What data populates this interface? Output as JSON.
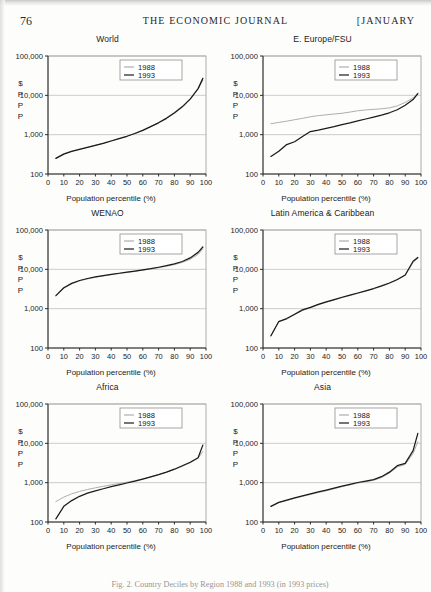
{
  "page": {
    "folio": "76",
    "journal_title": "THE ECONOMIC JOURNAL",
    "issue_month": "[JANUARY",
    "caption": "Fig. 2. Country Deciles by Region 1988 and 1993 (in 1993 prices)"
  },
  "legend": {
    "series_1988": "1988",
    "series_1993": "1993",
    "color_1988": "#aeaeae",
    "color_1993": "#1a1a1a"
  },
  "axes": {
    "y_unit_lines": [
      "$",
      "P",
      "P",
      "P"
    ],
    "y_ticks": [
      "100,000",
      "10,000",
      "1,000",
      "100"
    ],
    "y_tick_values": [
      100000,
      10000,
      1000,
      100
    ],
    "x_label": "Population percentile (%)",
    "x_ticks": [
      "0",
      "10",
      "20",
      "30",
      "40",
      "50",
      "60",
      "70",
      "80",
      "90",
      "100"
    ],
    "x_tick_values": [
      0,
      10,
      20,
      30,
      40,
      50,
      60,
      70,
      80,
      90,
      100
    ]
  },
  "chart_data": [
    {
      "type": "line",
      "title": "World",
      "xlabel": "Population percentile (%)",
      "ylabel": "$PPP",
      "yscale": "log",
      "ylim": [
        100,
        100000
      ],
      "xlim": [
        0,
        100
      ],
      "grid": true,
      "legend_position": "top-center",
      "x": [
        5,
        10,
        15,
        20,
        25,
        30,
        35,
        40,
        45,
        50,
        55,
        60,
        65,
        70,
        75,
        80,
        85,
        90,
        95,
        98
      ],
      "series": [
        {
          "name": "1988",
          "color": "#aeaeae",
          "values": [
            255,
            330,
            380,
            430,
            480,
            540,
            610,
            700,
            800,
            920,
            1080,
            1300,
            1620,
            2050,
            2700,
            3700,
            5300,
            8200,
            14500,
            24000
          ]
        },
        {
          "name": "1993",
          "color": "#1a1a1a",
          "values": [
            250,
            320,
            375,
            425,
            475,
            535,
            600,
            690,
            790,
            910,
            1070,
            1290,
            1600,
            2000,
            2600,
            3550,
            5100,
            8000,
            14800,
            27000
          ]
        }
      ]
    },
    {
      "type": "line",
      "title": "E. Europe/FSU",
      "xlabel": "Population percentile (%)",
      "ylabel": "$PPP",
      "yscale": "log",
      "ylim": [
        100,
        100000
      ],
      "xlim": [
        0,
        100
      ],
      "grid": true,
      "legend_position": "top-center",
      "x": [
        5,
        10,
        15,
        20,
        25,
        30,
        35,
        40,
        45,
        50,
        55,
        60,
        65,
        70,
        75,
        80,
        85,
        90,
        95,
        98
      ],
      "series": [
        {
          "name": "1988",
          "color": "#aeaeae",
          "values": [
            1900,
            2050,
            2200,
            2400,
            2600,
            2850,
            3050,
            3200,
            3350,
            3500,
            3750,
            4050,
            4250,
            4400,
            4550,
            4800,
            5400,
            6600,
            8600,
            11500
          ]
        },
        {
          "name": "1993",
          "color": "#1a1a1a",
          "values": [
            280,
            380,
            560,
            660,
            900,
            1200,
            1300,
            1450,
            1600,
            1800,
            2000,
            2250,
            2500,
            2800,
            3150,
            3600,
            4300,
            5600,
            7800,
            11000
          ]
        }
      ]
    },
    {
      "type": "line",
      "title": "WENAO",
      "xlabel": "Population percentile (%)",
      "ylabel": "$PPP",
      "yscale": "log",
      "ylim": [
        100,
        100000
      ],
      "xlim": [
        0,
        100
      ],
      "grid": true,
      "legend_position": "top-center",
      "x": [
        5,
        10,
        15,
        20,
        25,
        30,
        35,
        40,
        45,
        50,
        55,
        60,
        65,
        70,
        75,
        80,
        85,
        90,
        95,
        98
      ],
      "series": [
        {
          "name": "1988",
          "color": "#aeaeae",
          "values": [
            2100,
            3300,
            4300,
            5100,
            5700,
            6300,
            6800,
            7300,
            7800,
            8300,
            8900,
            9500,
            10200,
            11000,
            12000,
            13200,
            15000,
            18000,
            24000,
            33000
          ]
        },
        {
          "name": "1993",
          "color": "#1a1a1a",
          "values": [
            2150,
            3400,
            4400,
            5200,
            5850,
            6450,
            6950,
            7450,
            7950,
            8450,
            9050,
            9700,
            10400,
            11300,
            12400,
            13800,
            15800,
            19500,
            27000,
            37000
          ]
        }
      ]
    },
    {
      "type": "line",
      "title": "Latin America & Caribbean",
      "xlabel": "Population percentile (%)",
      "ylabel": "$PPP",
      "yscale": "log",
      "ylim": [
        100,
        100000
      ],
      "xlim": [
        0,
        100
      ],
      "grid": true,
      "legend_position": "top-center",
      "x": [
        5,
        10,
        15,
        20,
        25,
        30,
        35,
        40,
        45,
        50,
        55,
        60,
        65,
        70,
        75,
        80,
        85,
        90,
        95,
        98
      ],
      "series": [
        {
          "name": "1988",
          "color": "#aeaeae",
          "values": [
            200,
            480,
            540,
            700,
            900,
            1050,
            1250,
            1450,
            1650,
            1900,
            2150,
            2450,
            2800,
            3200,
            3700,
            4400,
            5400,
            7000,
            15000,
            19000
          ]
        },
        {
          "name": "1993",
          "color": "#1a1a1a",
          "values": [
            205,
            470,
            560,
            720,
            930,
            1080,
            1280,
            1480,
            1700,
            1950,
            2200,
            2500,
            2850,
            3250,
            3800,
            4500,
            5500,
            7200,
            16000,
            20000
          ]
        }
      ]
    },
    {
      "type": "line",
      "title": "Africa",
      "xlabel": "Population percentile (%)",
      "ylabel": "$PPP",
      "yscale": "log",
      "ylim": [
        100,
        100000
      ],
      "xlim": [
        0,
        100
      ],
      "grid": true,
      "legend_position": "top-center",
      "x": [
        5,
        10,
        15,
        20,
        25,
        30,
        35,
        40,
        45,
        50,
        55,
        60,
        65,
        70,
        75,
        80,
        85,
        90,
        95,
        98
      ],
      "series": [
        {
          "name": "1988",
          "color": "#aeaeae",
          "values": [
            330,
            430,
            520,
            600,
            670,
            740,
            810,
            880,
            950,
            1030,
            1120,
            1250,
            1400,
            1600,
            1850,
            2150,
            2600,
            3200,
            4200,
            6200
          ]
        },
        {
          "name": "1993",
          "color": "#1a1a1a",
          "values": [
            120,
            250,
            350,
            450,
            540,
            620,
            700,
            790,
            880,
            980,
            1090,
            1230,
            1400,
            1600,
            1850,
            2200,
            2700,
            3300,
            4300,
            9000
          ]
        }
      ]
    },
    {
      "type": "line",
      "title": "Asia",
      "xlabel": "Population percentile (%)",
      "ylabel": "$PPP",
      "yscale": "log",
      "ylim": [
        100,
        100000
      ],
      "xlim": [
        0,
        100
      ],
      "grid": true,
      "legend_position": "top-center",
      "x": [
        5,
        10,
        15,
        20,
        25,
        30,
        35,
        40,
        45,
        50,
        55,
        60,
        65,
        70,
        75,
        80,
        85,
        90,
        95,
        98
      ],
      "series": [
        {
          "name": "1988",
          "color": "#aeaeae",
          "values": [
            250,
            310,
            350,
            400,
            450,
            500,
            560,
            620,
            700,
            790,
            880,
            980,
            1060,
            1150,
            1350,
            1750,
            2500,
            2900,
            5500,
            11000
          ]
        },
        {
          "name": "1993",
          "color": "#1a1a1a",
          "values": [
            250,
            315,
            360,
            410,
            460,
            520,
            580,
            650,
            730,
            820,
            910,
            1010,
            1100,
            1200,
            1420,
            1850,
            2700,
            3100,
            6500,
            18000
          ]
        }
      ]
    }
  ]
}
